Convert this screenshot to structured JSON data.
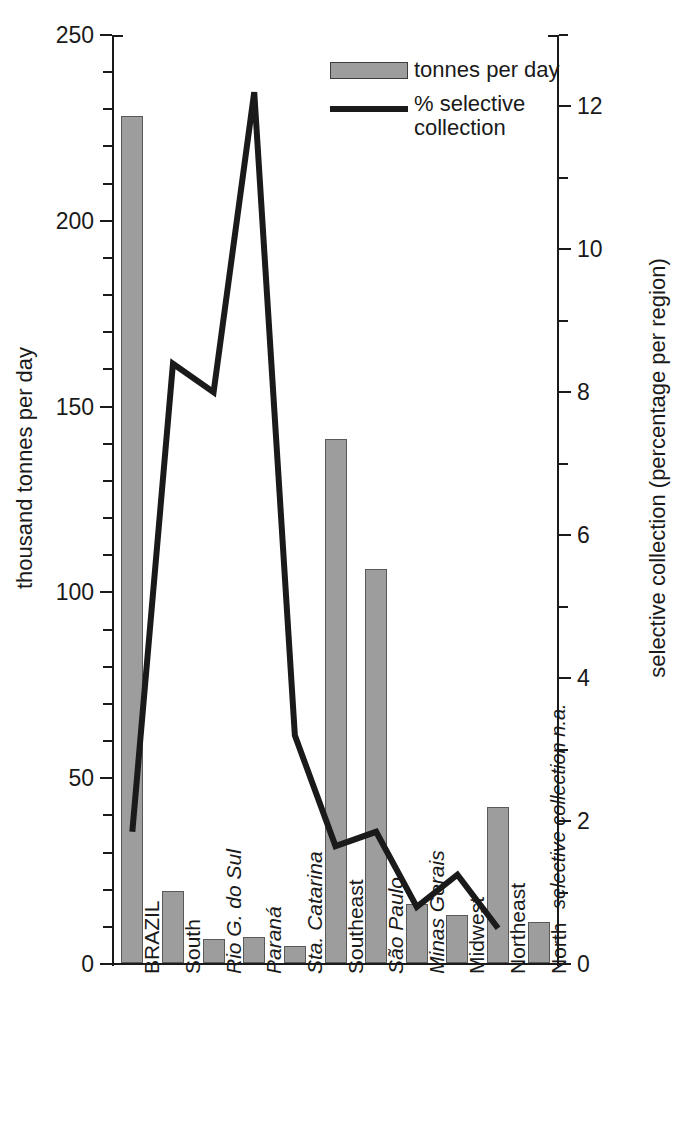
{
  "chart_data": {
    "type": "bar",
    "title": "",
    "subtitle": "",
    "xlabel": "",
    "ylabel": "thousand tonnes per day",
    "y2label": "selective collection (percentage per region)",
    "categories": [
      "BRAZIL",
      "South",
      "Rio G. do Sul",
      "Paraná",
      "Sta. Catarina",
      "Southeast",
      "São Paulo",
      "Minas Gerais",
      "Midwest",
      "Northeast",
      "North"
    ],
    "category_styles": [
      "normal",
      "normal",
      "italic",
      "italic",
      "italic",
      "normal",
      "italic",
      "italic",
      "normal",
      "normal",
      "normal"
    ],
    "series": [
      {
        "name": "tonnes per day",
        "type": "bar",
        "axis": "left",
        "unit": "thousand tonnes per day",
        "color": "#9d9d9d",
        "values": [
          228,
          19.5,
          6.5,
          7,
          4.5,
          141,
          106,
          16,
          13,
          42,
          11
        ]
      },
      {
        "name": "% selective collection",
        "type": "line",
        "axis": "right",
        "unit": "percentage per region",
        "color": "#1a1a1a",
        "values": [
          1.85,
          8.4,
          8.0,
          12.2,
          3.2,
          1.65,
          1.85,
          0.8,
          1.25,
          0.5,
          null
        ]
      }
    ],
    "ylim": [
      0,
      250
    ],
    "y2lim": [
      0,
      13
    ],
    "yticks": [
      0,
      50,
      100,
      150,
      200,
      250
    ],
    "ytick_labels": [
      "0",
      "50",
      "100",
      "150",
      "200",
      "250"
    ],
    "y_minor_step": 10,
    "y2ticks": [
      0,
      2,
      4,
      6,
      8,
      10,
      12
    ],
    "y2tick_labels": [
      "0",
      "2",
      "4",
      "6",
      "8",
      "10",
      "12"
    ],
    "y2_minor_step": 1,
    "grid": false,
    "legend_position": "top-center",
    "annotations": [
      {
        "text": "selective collection n.a.",
        "at_category": "North",
        "orientation": "vertical",
        "style": "italic"
      }
    ]
  },
  "axes": {
    "left_title": "thousand tonnes per day",
    "right_title": "selective collection (percentage per region)",
    "left_tick_labels": [
      "250",
      "200",
      "150",
      "100",
      "50",
      "0"
    ],
    "right_tick_labels": [
      "12",
      "10",
      "8",
      "6",
      "4",
      "2",
      "0"
    ]
  },
  "legend": {
    "items": [
      {
        "label": "tonnes per day",
        "marker": "bar-swatch"
      },
      {
        "label": "% selective\ncollection",
        "label_line1": "% selective",
        "label_line2": "collection",
        "marker": "line-swatch"
      }
    ]
  },
  "colors": {
    "bar_fill": "#9d9d9d",
    "bar_stroke": "#595959",
    "line": "#1a1a1a",
    "axis": "#1a1a1a",
    "text": "#1a1a1a",
    "background": "#ffffff"
  }
}
